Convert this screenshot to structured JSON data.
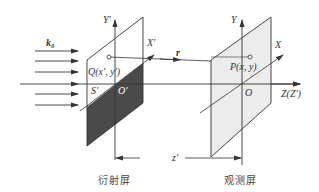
{
  "diagram": {
    "type": "optics-diffraction-geometry",
    "colors": {
      "line": "#333333",
      "dark_screen": "#4a4a4a",
      "observation_screen": "#ececec",
      "background": "#ffffff"
    },
    "incident_wave": {
      "label": "k₀",
      "arrow_count": 6
    },
    "diffraction_screen": {
      "caption": "衍射屏",
      "aperture_label": "S'",
      "origin_label": "O'",
      "y_axis_label": "Y'",
      "x_axis_label": "X'",
      "point_label": "Q(x', y')"
    },
    "observation_screen": {
      "caption": "观测屏",
      "origin_label": "O",
      "y_axis_label": "Y",
      "x_axis_label": "X",
      "point_label": "P(x, y)"
    },
    "z_axis_label": "Z(Z')",
    "vector_label": "r",
    "distance_label": "z'"
  }
}
